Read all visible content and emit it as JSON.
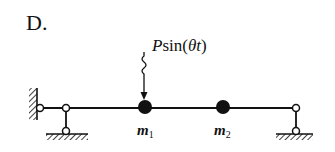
{
  "option": "D.",
  "load": {
    "symbol": "P",
    "function": "sin(",
    "argument": "θt",
    "close": ")"
  },
  "masses": [
    {
      "name": "m",
      "sub": "1"
    },
    {
      "name": "m",
      "sub": "2"
    }
  ],
  "colors": {
    "ink": "#111111",
    "background": "#ffffff"
  }
}
